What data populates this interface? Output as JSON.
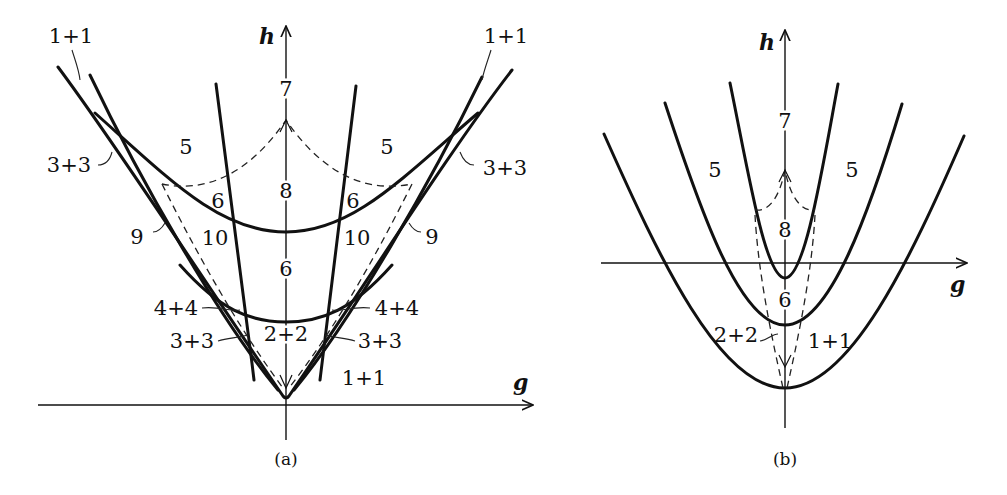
{
  "figure": {
    "panel_a": {
      "caption": "(a)",
      "axes": {
        "x_label": "g",
        "y_label": "h"
      },
      "region_labels": {
        "top_left": "1+1",
        "top_right": "1+1",
        "left_mid": "3+3",
        "right_mid": "3+3",
        "five_left": "5",
        "five_right": "5",
        "seven": "7",
        "eight": "8",
        "six_left": "6",
        "six_right": "6",
        "nine_left": "9",
        "nine_right": "9",
        "ten_left": "10",
        "ten_right": "10",
        "six_center": "6",
        "four_left": "4+4",
        "four_right": "4+4",
        "three_low_left": "3+3",
        "three_low_right": "3+3",
        "two_center": "2+2",
        "one_low_right": "1+1"
      }
    },
    "panel_b": {
      "caption": "(b)",
      "axes": {
        "x_label": "g",
        "y_label": "h"
      },
      "region_labels": {
        "five_left": "5",
        "five_right": "5",
        "seven": "7",
        "eight": "8",
        "six": "6",
        "two": "2+2",
        "one": "1+1"
      }
    },
    "colors": {
      "line": "#111111",
      "background": "#ffffff"
    }
  }
}
